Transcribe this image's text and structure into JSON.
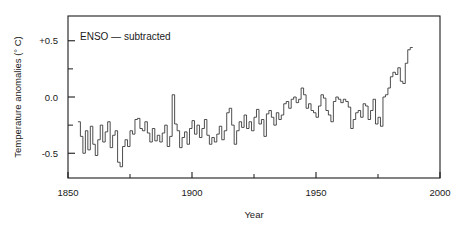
{
  "chart_data": {
    "type": "line",
    "title": "",
    "annotation": "ENSO — subtracted",
    "xlabel": "Year",
    "ylabel": "Temperature anomalies (° C)",
    "xlim": [
      1850,
      2000
    ],
    "ylim": [
      -0.72,
      0.72
    ],
    "grid": false,
    "legend": null,
    "x_major_ticks": [
      1850,
      1900,
      1950,
      2000
    ],
    "x_major_tick_labels": [
      "1850",
      "1900",
      "1950",
      "2000"
    ],
    "x_minor_ticks": [
      1875,
      1925,
      1975
    ],
    "y_major_ticks": [
      -0.5,
      0.0,
      0.5
    ],
    "y_major_tick_labels": [
      "-0.5",
      "0.0",
      "+0.5"
    ],
    "y_minor_ticks": [
      -0.25,
      0.25
    ],
    "series": [
      {
        "name": "Global temperature anomaly (ENSO subtracted)",
        "step": "pre",
        "color": "#3a3a3a",
        "x": [
          1854,
          1855,
          1856,
          1857,
          1858,
          1859,
          1860,
          1861,
          1862,
          1863,
          1864,
          1865,
          1866,
          1867,
          1868,
          1869,
          1870,
          1871,
          1872,
          1873,
          1874,
          1875,
          1876,
          1877,
          1878,
          1879,
          1880,
          1881,
          1882,
          1883,
          1884,
          1885,
          1886,
          1887,
          1888,
          1889,
          1890,
          1891,
          1892,
          1893,
          1894,
          1895,
          1896,
          1897,
          1898,
          1899,
          1900,
          1901,
          1902,
          1903,
          1904,
          1905,
          1906,
          1907,
          1908,
          1909,
          1910,
          1911,
          1912,
          1913,
          1914,
          1915,
          1916,
          1917,
          1918,
          1919,
          1920,
          1921,
          1922,
          1923,
          1924,
          1925,
          1926,
          1927,
          1928,
          1929,
          1930,
          1931,
          1932,
          1933,
          1934,
          1935,
          1936,
          1937,
          1938,
          1939,
          1940,
          1941,
          1942,
          1943,
          1944,
          1945,
          1946,
          1947,
          1948,
          1949,
          1950,
          1951,
          1952,
          1953,
          1954,
          1955,
          1956,
          1957,
          1958,
          1959,
          1960,
          1961,
          1962,
          1963,
          1964,
          1965,
          1966,
          1967,
          1968,
          1969,
          1970,
          1971,
          1972,
          1973,
          1974,
          1975,
          1976,
          1977,
          1978,
          1979,
          1980,
          1981,
          1982,
          1983,
          1984,
          1985,
          1986,
          1987,
          1988
        ],
        "y": [
          -0.22,
          -0.35,
          -0.5,
          -0.3,
          -0.47,
          -0.26,
          -0.42,
          -0.52,
          -0.38,
          -0.25,
          -0.4,
          -0.31,
          -0.22,
          -0.45,
          -0.34,
          -0.3,
          -0.58,
          -0.62,
          -0.44,
          -0.38,
          -0.44,
          -0.3,
          -0.33,
          -0.2,
          -0.19,
          -0.28,
          -0.3,
          -0.22,
          -0.32,
          -0.4,
          -0.28,
          -0.39,
          -0.34,
          -0.4,
          -0.32,
          -0.25,
          -0.44,
          -0.35,
          0.02,
          -0.24,
          -0.3,
          -0.45,
          -0.36,
          -0.31,
          -0.42,
          -0.28,
          -0.21,
          -0.33,
          -0.25,
          -0.36,
          -0.28,
          -0.2,
          -0.34,
          -0.42,
          -0.36,
          -0.4,
          -0.33,
          -0.26,
          -0.38,
          -0.3,
          -0.14,
          -0.1,
          -0.25,
          -0.42,
          -0.3,
          -0.22,
          -0.27,
          -0.16,
          -0.28,
          -0.22,
          -0.3,
          -0.18,
          -0.11,
          -0.24,
          -0.2,
          -0.35,
          -0.15,
          -0.12,
          -0.18,
          -0.25,
          -0.14,
          -0.2,
          -0.16,
          -0.06,
          -0.04,
          -0.1,
          -0.02,
          0.0,
          -0.05,
          -0.02,
          0.08,
          0.02,
          -0.1,
          -0.06,
          -0.12,
          -0.14,
          -0.18,
          -0.08,
          0.02,
          -0.01,
          -0.12,
          -0.16,
          -0.22,
          -0.04,
          0.0,
          -0.02,
          -0.05,
          -0.02,
          -0.04,
          -0.09,
          -0.28,
          -0.2,
          -0.14,
          -0.12,
          -0.18,
          -0.06,
          -0.08,
          -0.2,
          -0.12,
          -0.02,
          -0.24,
          -0.18,
          -0.26,
          0.0,
          0.02,
          0.08,
          0.18,
          0.22,
          0.2,
          0.26,
          0.14,
          0.12,
          0.3,
          0.42,
          0.44
        ]
      }
    ]
  },
  "plot": {
    "frame_left": 68,
    "frame_right": 440,
    "frame_top": 16,
    "frame_bottom": 178,
    "x_zero_year": 1850,
    "y_pixels_per_unit": 104
  }
}
